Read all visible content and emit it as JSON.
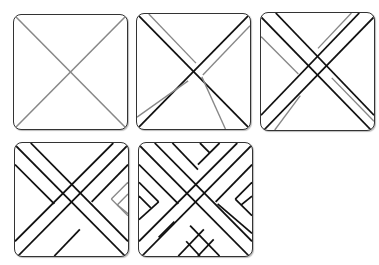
{
  "diagram": {
    "type": "zentangle-step-sequence",
    "steps": [
      {
        "step": 1,
        "description": "Tile with two gray diagonal lines forming an X"
      },
      {
        "step": 2,
        "description": "Black X drawn with parallel gray guide lines forming bands"
      },
      {
        "step": 3,
        "description": "Two crossing diagonal bands of parallel black lines with gray next bands"
      },
      {
        "step": 4,
        "description": "Woven diagonal bands with gray chevrons in right corner"
      },
      {
        "step": 5,
        "description": "Complete basket-weave herringbone pattern filling the tile"
      }
    ],
    "colors": {
      "ink": "#111111",
      "guide": "#888888",
      "border": "#333333",
      "background": "#ffffff"
    }
  }
}
